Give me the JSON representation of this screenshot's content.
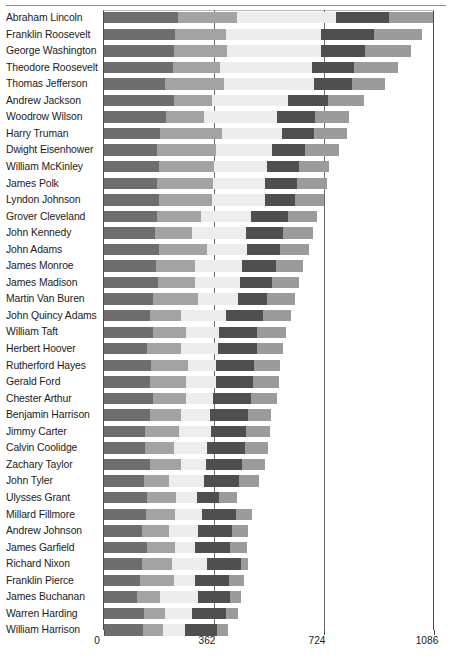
{
  "chart_data": {
    "type": "bar",
    "orientation": "horizontal",
    "stacked": true,
    "title": "",
    "subtitle": "",
    "xlabel": "",
    "ylabel": "",
    "xlim": [
      0,
      1086
    ],
    "ticks": [
      0,
      362,
      724,
      1086
    ],
    "tick_labels": [
      "0",
      "362",
      "724",
      "1086"
    ],
    "grid": true,
    "grid_axis": "x",
    "legend": "none",
    "segment_colors": [
      "#6e6e6e",
      "#a3a3a3",
      "#ededed",
      "#4f4f4f",
      "#9b9b9b"
    ],
    "categories": [
      "Abraham Lincoln",
      "Franklin Roosevelt",
      "George Washington",
      "Theodore Roosevelt",
      "Thomas Jefferson",
      "Andrew Jackson",
      "Woodrow Wilson",
      "Harry Truman",
      "Dwight Eisenhower",
      "William McKinley",
      "James Polk",
      "Lyndon Johnson",
      "Grover Cleveland",
      "John Kennedy",
      "John Adams",
      "James Monroe",
      "James Madison",
      "Martin Van Buren",
      "John Quincy Adams",
      "William Taft",
      "Herbert Hoover",
      "Rutherford Hayes",
      "Gerald Ford",
      "Chester Arthur",
      "Benjamin Harrison",
      "Jimmy Carter",
      "Calvin Coolidge",
      "Zachary Taylor",
      "John Tyler",
      "Ulysses Grant",
      "Millard Fillmore",
      "Andrew Johnson",
      "James Garfield",
      "Richard Nixon",
      "Franklin Pierce",
      "James Buchanan",
      "Warren Harding",
      "William Harrison"
    ],
    "series": [
      {
        "name": "Segment 1",
        "values": [
          245,
          235,
          230,
          228,
          200,
          232,
          205,
          185,
          175,
          180,
          175,
          180,
          175,
          168,
          180,
          172,
          178,
          160,
          150,
          162,
          140,
          155,
          150,
          160,
          150,
          135,
          135,
          150,
          130,
          142,
          138,
          125,
          140,
          125,
          120,
          110,
          130,
          128
        ]
      },
      {
        "name": "Segment 2",
        "values": [
          192,
          165,
          175,
          155,
          195,
          125,
          125,
          205,
          192,
          182,
          185,
          175,
          145,
          120,
          160,
          128,
          120,
          150,
          105,
          108,
          115,
          120,
          120,
          110,
          105,
          112,
          95,
          105,
          85,
          95,
          95,
          90,
          95,
          100,
          110,
          75,
          70,
          65
        ]
      },
      {
        "name": "Segment 3",
        "values": [
          325,
          315,
          310,
          300,
          295,
          250,
          240,
          195,
          185,
          175,
          170,
          175,
          165,
          180,
          130,
          155,
          150,
          130,
          145,
          110,
          120,
          95,
          100,
          90,
          95,
          105,
          110,
          80,
          115,
          70,
          90,
          95,
          65,
          115,
          70,
          125,
          90,
          75
        ]
      },
      {
        "name": "Segment 4",
        "values": [
          175,
          175,
          145,
          140,
          125,
          130,
          125,
          105,
          110,
          105,
          105,
          100,
          120,
          120,
          110,
          110,
          105,
          95,
          125,
          125,
          130,
          125,
          120,
          125,
          125,
          115,
          125,
          120,
          115,
          70,
          110,
          110,
          115,
          110,
          110,
          105,
          110,
          105
        ]
      },
      {
        "name": "Segment 5",
        "values": [
          145,
          155,
          150,
          145,
          110,
          120,
          110,
          110,
          110,
          100,
          100,
          95,
          95,
          100,
          95,
          90,
          90,
          95,
          90,
          95,
          85,
          85,
          85,
          85,
          75,
          80,
          75,
          75,
          65,
          60,
          55,
          55,
          55,
          25,
          50,
          35,
          40,
          35
        ]
      }
    ]
  }
}
